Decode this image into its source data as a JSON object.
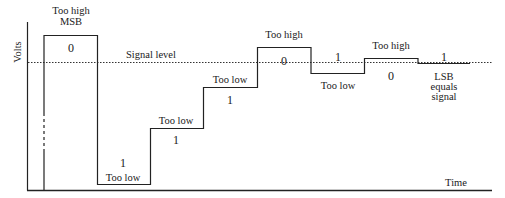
{
  "diagram": {
    "type": "successive-approximation-adc-timing",
    "axes": {
      "y_label": "Volts",
      "x_label": "Time"
    },
    "signal_level_label": "Signal level",
    "steps": [
      {
        "bit": "0",
        "label_top": "Too high",
        "label_sub": "MSB"
      },
      {
        "bit": "1",
        "label": "Too low"
      },
      {
        "bit": "1",
        "label": "Too low"
      },
      {
        "bit": "1",
        "label": "Too low"
      },
      {
        "bit": "0",
        "label": "Too high"
      },
      {
        "bit": "1",
        "label": "Too low"
      },
      {
        "bit": "0",
        "label": "Too high"
      },
      {
        "bit": "1",
        "label_lines": [
          "LSB",
          "equals",
          "signal"
        ]
      }
    ]
  }
}
